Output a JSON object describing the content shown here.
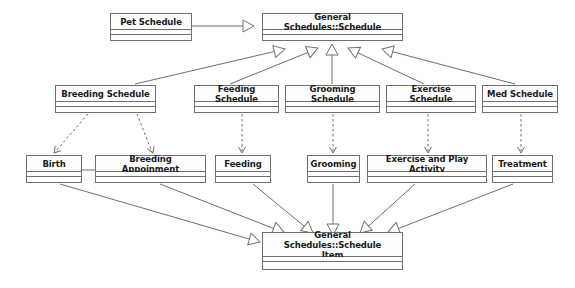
{
  "diagram": {
    "type": "uml-class-diagram",
    "background_color": "#ffffff",
    "line_color": "#6f6f6f",
    "text_color": "#1a1a1a",
    "nodes": [
      {
        "id": "pet_schedule",
        "label": "Pet Schedule",
        "x": 110,
        "y": 13,
        "w": 82,
        "h": 28
      },
      {
        "id": "general_schedule",
        "label": "General Schedules::Schedule",
        "x": 262,
        "y": 13,
        "w": 141,
        "h": 28
      },
      {
        "id": "breeding_schedule",
        "label": "Breeding Schedule",
        "x": 55,
        "y": 85,
        "w": 101,
        "h": 28
      },
      {
        "id": "feeding_schedule",
        "label": "Feeding Schedule",
        "x": 194,
        "y": 85,
        "w": 85,
        "h": 28
      },
      {
        "id": "grooming_schedule",
        "label": "Grooming Schedule",
        "x": 285,
        "y": 85,
        "w": 95,
        "h": 28
      },
      {
        "id": "exercise_schedule",
        "label": "Exercise Schedule",
        "x": 386,
        "y": 85,
        "w": 90,
        "h": 28
      },
      {
        "id": "med_schedule",
        "label": "Med Schedule",
        "x": 482,
        "y": 85,
        "w": 76,
        "h": 28
      },
      {
        "id": "birth",
        "label": "Birth",
        "x": 26,
        "y": 155,
        "w": 56,
        "h": 28
      },
      {
        "id": "breeding_appoinment",
        "label": "Breeding Appoinment",
        "x": 95,
        "y": 155,
        "w": 111,
        "h": 28
      },
      {
        "id": "feeding",
        "label": "Feeding",
        "x": 215,
        "y": 155,
        "w": 56,
        "h": 28
      },
      {
        "id": "grooming",
        "label": "Grooming",
        "x": 307,
        "y": 155,
        "w": 53,
        "h": 28
      },
      {
        "id": "exercise_play",
        "label": "Exercise and Play Activity",
        "x": 367,
        "y": 155,
        "w": 120,
        "h": 28
      },
      {
        "id": "treatment",
        "label": "Treatment",
        "x": 492,
        "y": 155,
        "w": 61,
        "h": 28
      },
      {
        "id": "schedule_item",
        "label": "General Schedules::Schedule\nItem",
        "x": 262,
        "y": 232,
        "w": 141,
        "h": 38
      }
    ],
    "edges": [
      {
        "id": "e-pet-schedule",
        "from": "pet_schedule",
        "to": "general_schedule",
        "style": "generalization"
      },
      {
        "id": "e-breeding-schedule",
        "from": "breeding_schedule",
        "to": "general_schedule",
        "style": "generalization"
      },
      {
        "id": "e-feeding-schedule",
        "from": "feeding_schedule",
        "to": "general_schedule",
        "style": "generalization"
      },
      {
        "id": "e-grooming-schedule",
        "from": "grooming_schedule",
        "to": "general_schedule",
        "style": "generalization"
      },
      {
        "id": "e-exercise-schedule",
        "from": "exercise_schedule",
        "to": "general_schedule",
        "style": "generalization"
      },
      {
        "id": "e-med-schedule",
        "from": "med_schedule",
        "to": "general_schedule",
        "style": "generalization"
      },
      {
        "id": "e-breeding-birth",
        "from": "breeding_schedule",
        "to": "birth",
        "style": "dependency"
      },
      {
        "id": "e-breeding-appoinment",
        "from": "breeding_schedule",
        "to": "breeding_appoinment",
        "style": "dependency"
      },
      {
        "id": "e-feeding-dep",
        "from": "feeding_schedule",
        "to": "feeding",
        "style": "dependency"
      },
      {
        "id": "e-grooming-dep",
        "from": "grooming_schedule",
        "to": "grooming",
        "style": "dependency"
      },
      {
        "id": "e-exercise-dep",
        "from": "exercise_schedule",
        "to": "exercise_play",
        "style": "dependency"
      },
      {
        "id": "e-med-treatment",
        "from": "med_schedule",
        "to": "treatment",
        "style": "dependency"
      },
      {
        "id": "e-birth-appoinment",
        "from": "birth",
        "to": "breeding_appoinment",
        "style": "association"
      },
      {
        "id": "e-birth-item",
        "from": "birth",
        "to": "schedule_item",
        "style": "generalization"
      },
      {
        "id": "e-appoinment-item",
        "from": "breeding_appoinment",
        "to": "schedule_item",
        "style": "generalization"
      },
      {
        "id": "e-feeding-item",
        "from": "feeding",
        "to": "schedule_item",
        "style": "generalization"
      },
      {
        "id": "e-grooming-item",
        "from": "grooming",
        "to": "schedule_item",
        "style": "generalization"
      },
      {
        "id": "e-exercise-item",
        "from": "exercise_play",
        "to": "schedule_item",
        "style": "generalization"
      },
      {
        "id": "e-treatment-item",
        "from": "treatment",
        "to": "schedule_item",
        "style": "generalization"
      }
    ],
    "edge_paths": {
      "e-pet-schedule": {
        "d": "M 192 26 L 254 26",
        "head": "hollow-triangle",
        "hx": 254,
        "hy": 26,
        "angle": 0
      },
      "e-breeding-schedule": {
        "d": "M 135 84 L 281 50",
        "head": "hollow-triangle",
        "hx": 285,
        "hy": 49,
        "angle": -13
      },
      "e-feeding-schedule": {
        "d": "M 230 84 L 314 50",
        "head": "hollow-triangle",
        "hx": 318,
        "hy": 48,
        "angle": -22
      },
      "e-grooming-schedule": {
        "d": "M 332 84 L 332 49",
        "head": "hollow-triangle",
        "hx": 332,
        "hy": 44,
        "angle": -90
      },
      "e-exercise-schedule": {
        "d": "M 424 84 L 352 50",
        "head": "hollow-triangle",
        "hx": 348,
        "hy": 48,
        "angle": -155
      },
      "e-med-schedule": {
        "d": "M 515 84 L 386 50",
        "head": "hollow-triangle",
        "hx": 382,
        "hy": 49,
        "angle": -165
      },
      "e-breeding-birth": {
        "d": "M 88 114 L 55 152",
        "head": "open-arrow",
        "hx": 54,
        "hy": 153,
        "angle": 131
      },
      "e-breeding-appoinment": {
        "d": "M 137 114 L 152 152",
        "head": "open-arrow",
        "hx": 153,
        "hy": 153,
        "angle": 69
      },
      "e-feeding-dep": {
        "d": "M 242 114 L 242 152",
        "head": "open-arrow",
        "hx": 242,
        "hy": 153,
        "angle": 90
      },
      "e-grooming-dep": {
        "d": "M 333 114 L 333 152",
        "head": "open-arrow",
        "hx": 333,
        "hy": 153,
        "angle": 90
      },
      "e-exercise-dep": {
        "d": "M 428 114 L 428 152",
        "head": "open-arrow",
        "hx": 428,
        "hy": 153,
        "angle": 90
      },
      "e-med-treatment": {
        "d": "M 521 114 L 521 152",
        "head": "open-arrow",
        "hx": 521,
        "hy": 153,
        "angle": 90
      },
      "e-birth-appoinment": {
        "d": "M 82 170 L 95 170",
        "head": "none",
        "hx": 0,
        "hy": 0,
        "angle": 0
      },
      "e-birth-item": {
        "d": "M 60 184 L 256 241",
        "head": "hollow-triangle",
        "hx": 260,
        "hy": 242,
        "angle": 16
      },
      "e-appoinment-item": {
        "d": "M 160 184 L 280 231",
        "head": "hollow-triangle",
        "hx": 284,
        "hy": 232,
        "angle": 21
      },
      "e-feeding-item": {
        "d": "M 253 184 L 310 231",
        "head": "hollow-triangle",
        "hx": 313,
        "hy": 233,
        "angle": 39
      },
      "e-grooming-item": {
        "d": "M 333 184 L 333 230",
        "head": "hollow-triangle",
        "hx": 333,
        "hy": 235,
        "angle": 90
      },
      "e-exercise-item": {
        "d": "M 415 184 L 363 231",
        "head": "hollow-triangle",
        "hx": 360,
        "hy": 233,
        "angle": 138
      },
      "e-treatment-item": {
        "d": "M 513 184 L 392 231",
        "head": "hollow-triangle",
        "hx": 388,
        "hy": 232,
        "angle": 159
      }
    }
  }
}
